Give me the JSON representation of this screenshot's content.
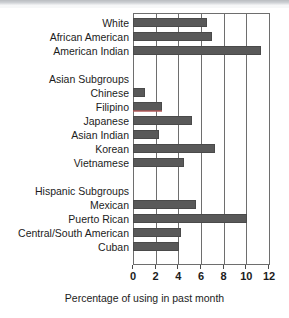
{
  "chart_data": {
    "type": "bar",
    "orientation": "horizontal",
    "title": "",
    "xlabel": "Percentage of using in past month",
    "ylabel": "",
    "xlim": [
      0,
      12
    ],
    "xticks": [
      0,
      2,
      4,
      6,
      8,
      10,
      12
    ],
    "grid": true,
    "legend": "none",
    "bar_color": "#595959",
    "categories": [
      "White",
      "African American",
      "American Indian",
      "",
      "Asian Subgroups",
      "Chinese",
      "Filipino",
      "Japanese",
      "Asian Indian",
      "Korean",
      "Vietnamese",
      "",
      "Hispanic Subgroups",
      "Mexican",
      "Puerto Rican",
      "Central/South American",
      "Cuban"
    ],
    "values": [
      6.5,
      7.0,
      11.3,
      null,
      null,
      1.1,
      2.6,
      5.2,
      2.3,
      7.2,
      4.5,
      null,
      null,
      5.6,
      10.1,
      4.2,
      4.1
    ],
    "headers": [
      "Asian Subgroups",
      "Hispanic Subgroups"
    ],
    "annotations": [
      {
        "category": "Filipino",
        "type": "red-underline",
        "color": "#b05a5a"
      }
    ]
  },
  "rows": [
    {
      "label": "White",
      "value": 6.5,
      "is_header": false,
      "has_bar": true
    },
    {
      "label": "African American",
      "value": 7.0,
      "is_header": false,
      "has_bar": true
    },
    {
      "label": "American Indian",
      "value": 11.3,
      "is_header": false,
      "has_bar": true
    },
    {
      "label": "",
      "value": null,
      "is_header": false,
      "has_bar": false
    },
    {
      "label": "Asian Subgroups",
      "value": null,
      "is_header": true,
      "has_bar": false
    },
    {
      "label": "Chinese",
      "value": 1.1,
      "is_header": false,
      "has_bar": true
    },
    {
      "label": "Filipino",
      "value": 2.6,
      "is_header": false,
      "has_bar": true
    },
    {
      "label": "Japanese",
      "value": 5.2,
      "is_header": false,
      "has_bar": true
    },
    {
      "label": "Asian Indian",
      "value": 2.3,
      "is_header": false,
      "has_bar": true
    },
    {
      "label": "Korean",
      "value": 7.2,
      "is_header": false,
      "has_bar": true
    },
    {
      "label": "Vietnamese",
      "value": 4.5,
      "is_header": false,
      "has_bar": true
    },
    {
      "label": "",
      "value": null,
      "is_header": false,
      "has_bar": false
    },
    {
      "label": "Hispanic Subgroups",
      "value": null,
      "is_header": true,
      "has_bar": false
    },
    {
      "label": "Mexican",
      "value": 5.6,
      "is_header": false,
      "has_bar": true
    },
    {
      "label": "Puerto Rican",
      "value": 10.1,
      "is_header": false,
      "has_bar": true
    },
    {
      "label": "Central/South American",
      "value": 4.2,
      "is_header": false,
      "has_bar": true
    },
    {
      "label": "Cuban",
      "value": 4.1,
      "is_header": false,
      "has_bar": true
    }
  ],
  "axis": {
    "ticks": [
      "0",
      "2",
      "4",
      "6",
      "8",
      "10",
      "12"
    ],
    "tick_values": [
      0,
      2,
      4,
      6,
      8,
      10,
      12
    ],
    "title": "Percentage of using in past month"
  }
}
